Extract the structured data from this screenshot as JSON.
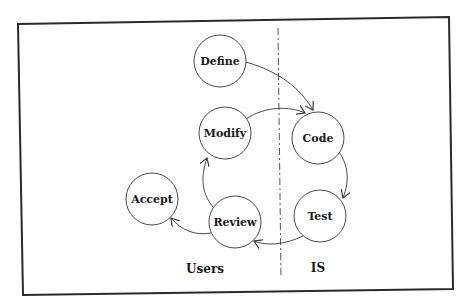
{
  "diagram": {
    "type": "process-cycle",
    "regions": [
      {
        "id": "users",
        "label": "Users",
        "x": 205,
        "y": 273
      },
      {
        "id": "is",
        "label": "IS",
        "x": 318,
        "y": 272
      }
    ],
    "nodes": [
      {
        "id": "define",
        "label": "Define",
        "cx": 220,
        "cy": 61,
        "r": 26,
        "region": "users"
      },
      {
        "id": "modify",
        "label": "Modify",
        "cx": 225,
        "cy": 133,
        "r": 26,
        "region": "users"
      },
      {
        "id": "code",
        "label": "Code",
        "cx": 318,
        "cy": 138,
        "r": 26,
        "region": "is"
      },
      {
        "id": "test",
        "label": "Test",
        "cx": 320,
        "cy": 216,
        "r": 26,
        "region": "is"
      },
      {
        "id": "review",
        "label": "Review",
        "cx": 235,
        "cy": 222,
        "r": 26,
        "region": "users"
      },
      {
        "id": "accept",
        "label": "Accept",
        "cx": 152,
        "cy": 199,
        "r": 26,
        "region": "users"
      }
    ],
    "edges": [
      {
        "from": "define",
        "to": "code"
      },
      {
        "from": "modify",
        "to": "code"
      },
      {
        "from": "code",
        "to": "test"
      },
      {
        "from": "test",
        "to": "review"
      },
      {
        "from": "review",
        "to": "modify"
      },
      {
        "from": "review",
        "to": "accept"
      }
    ],
    "colors": {
      "stroke": "#4a4a4a",
      "frame": "#2a2a2a",
      "text": "#1a1a1a",
      "background": "#ffffff"
    }
  }
}
